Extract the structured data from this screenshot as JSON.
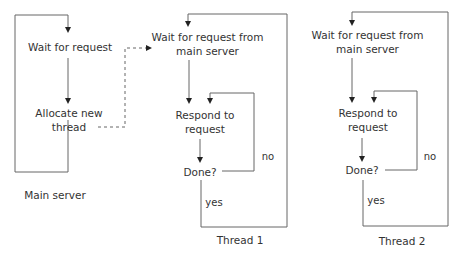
{
  "diagram": {
    "type": "flowchart",
    "line_color": "#555555",
    "text_color": "#333333",
    "main_server": {
      "caption": "Main server",
      "nodes": [
        {
          "id": "wait",
          "label": "Wait for request"
        },
        {
          "id": "allocate",
          "label_line1": "Allocate new",
          "label_line2": "thread"
        }
      ]
    },
    "thread1": {
      "caption": "Thread 1",
      "nodes": [
        {
          "id": "wait_main",
          "label_line1": "Wait for request from",
          "label_line2": "main server"
        },
        {
          "id": "respond",
          "label_line1": "Respond to",
          "label_line2": "request"
        },
        {
          "id": "done",
          "label": "Done?"
        }
      ],
      "edge_no": "no",
      "edge_yes": "yes"
    },
    "thread2": {
      "caption": "Thread 2",
      "nodes": [
        {
          "id": "wait_main",
          "label_line1": "Wait for request from",
          "label_line2": "main server"
        },
        {
          "id": "respond",
          "label_line1": "Respond to",
          "label_line2": "request"
        },
        {
          "id": "done",
          "label": "Done?"
        }
      ],
      "edge_no": "no",
      "edge_yes": "yes"
    },
    "edges": [
      {
        "from": "main.wait",
        "to": "main.allocate",
        "style": "solid"
      },
      {
        "from": "main.allocate",
        "to": "main.wait",
        "style": "solid",
        "note": "loop"
      },
      {
        "from": "main.allocate",
        "to": "thread1.wait_main",
        "style": "dashed"
      },
      {
        "from": "thread.wait_main",
        "to": "thread.respond",
        "style": "solid"
      },
      {
        "from": "thread.respond",
        "to": "thread.done",
        "style": "solid"
      },
      {
        "from": "thread.done",
        "to": "thread.respond",
        "label": "no",
        "style": "solid"
      },
      {
        "from": "thread.done",
        "to": "thread.wait_main",
        "label": "yes",
        "style": "solid"
      }
    ]
  }
}
